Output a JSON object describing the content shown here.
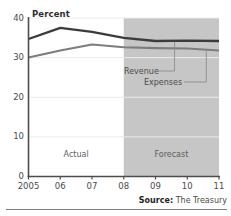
{
  "figure": {
    "title_remnant": "",
    "y_axis_unit": "Percent",
    "source_prefix": "Source:",
    "source_value": " The Treasury"
  },
  "annotations": {
    "actual": "Actual",
    "forecast": "Forecast",
    "revenue": "Revenue",
    "expenses": "Expenses"
  },
  "colors": {
    "revenue_line": "#3b3b3b",
    "expenses_line": "#7d7d7d",
    "forecast_band": "#c6c6c6",
    "axis": "#4d4d4d",
    "gridline": "#ececec",
    "rule": "#7d7d7d"
  },
  "chart_data": {
    "type": "line",
    "title": "",
    "xlabel": "",
    "ylabel": "Percent",
    "ylim": [
      0,
      40
    ],
    "yticks": [
      0,
      10,
      20,
      30,
      40
    ],
    "ytick_labels": [
      "0",
      "10",
      "20",
      "30",
      "40"
    ],
    "x": [
      2005,
      2006,
      2007,
      2008,
      2009,
      2010,
      2011
    ],
    "xtick_labels": [
      "2005",
      "06",
      "07",
      "08",
      "09",
      "10",
      "11"
    ],
    "grid": true,
    "legend_position": "inline-callouts",
    "series": [
      {
        "name": "Revenue",
        "color": "#3b3b3b",
        "values": [
          34.7,
          37.5,
          36.5,
          35.0,
          34.2,
          34.3,
          34.2
        ]
      },
      {
        "name": "Expenses",
        "color": "#7d7d7d",
        "values": [
          30.0,
          31.8,
          33.3,
          32.6,
          32.4,
          32.3,
          31.8
        ]
      }
    ],
    "regions": [
      {
        "label": "Actual",
        "from": 2005,
        "to": 2008,
        "shaded": false
      },
      {
        "label": "Forecast",
        "from": 2008,
        "to": 2011,
        "shaded": true
      }
    ],
    "annotations": [
      {
        "text": "Revenue",
        "series": "Revenue",
        "points_to_x": 2009.6
      },
      {
        "text": "Expenses",
        "series": "Expenses",
        "points_to_x": 2010.6
      }
    ]
  }
}
